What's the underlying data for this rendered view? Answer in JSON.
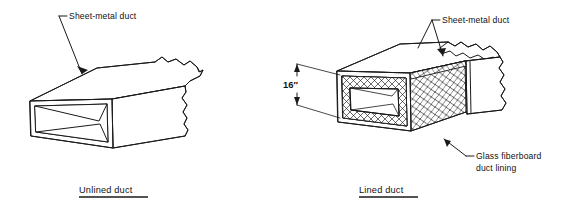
{
  "figure": {
    "title_visible": false,
    "background_color": "#ffffff",
    "line_color": "#1a1a1a"
  },
  "panels": [
    {
      "id": "unlined",
      "caption": "Unlined duct",
      "callouts": [
        {
          "id": "sheet-metal-duct-left",
          "label": "Sheet-metal duct",
          "points_to": "top-face-of-duct"
        }
      ]
    },
    {
      "id": "lined",
      "caption": "Lined duct",
      "dimension": {
        "value": "16″",
        "measures": "duct-interior-height"
      },
      "callouts": [
        {
          "id": "sheet-metal-duct-right",
          "label": "Sheet-metal duct",
          "points_to": "torn-sheet-metal-top"
        },
        {
          "id": "glass-fiberboard-duct-lining",
          "label_line_1": "Glass fiberboard",
          "label_line_2": "duct lining",
          "points_to": "hatched-lining-section"
        }
      ]
    }
  ],
  "icons": {
    "arrowhead": "arrowhead-icon",
    "dimension_arrow_up": "dimension-arrow-up-icon",
    "dimension_arrow_down": "dimension-arrow-down-icon"
  }
}
